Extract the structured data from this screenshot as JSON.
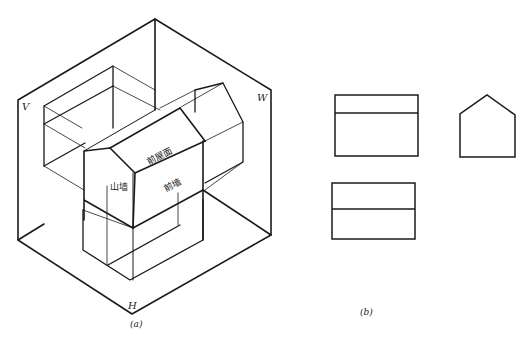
{
  "figure_a": {
    "caption": "(a)",
    "plane_labels": {
      "v": "V",
      "w": "W",
      "h": "H"
    },
    "part_labels": {
      "front_roof": "前屋面",
      "gable_wall": "山墙",
      "front_wall": "前墙"
    }
  },
  "figure_b": {
    "caption": "(b)",
    "views": [
      "front-view",
      "side-view",
      "top-view"
    ]
  },
  "colors": {
    "line": "#1a1a1a",
    "background": "#ffffff"
  }
}
